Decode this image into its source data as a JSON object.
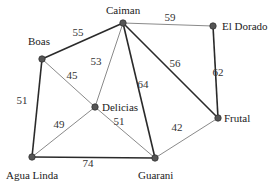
{
  "graph": {
    "nodes": [
      {
        "id": "caiman",
        "label": "Caiman"
      },
      {
        "id": "eldorado",
        "label": "El Dorado"
      },
      {
        "id": "boas",
        "label": "Boas"
      },
      {
        "id": "delicias",
        "label": "Delicias"
      },
      {
        "id": "frutal",
        "label": "Frutal"
      },
      {
        "id": "agualinda",
        "label": "Agua Linda"
      },
      {
        "id": "guarani",
        "label": "Guarani"
      }
    ],
    "edges": [
      {
        "from": "boas",
        "to": "caiman",
        "weight": "55",
        "highlighted": true
      },
      {
        "from": "caiman",
        "to": "eldorado",
        "weight": "59",
        "highlighted": false
      },
      {
        "from": "caiman",
        "to": "delicias",
        "weight": "53",
        "highlighted": false
      },
      {
        "from": "caiman",
        "to": "guarani",
        "weight": "64",
        "highlighted": true
      },
      {
        "from": "caiman",
        "to": "frutal",
        "weight": "56",
        "highlighted": true
      },
      {
        "from": "eldorado",
        "to": "frutal",
        "weight": "62",
        "highlighted": true
      },
      {
        "from": "boas",
        "to": "delicias",
        "weight": "45",
        "highlighted": false
      },
      {
        "from": "boas",
        "to": "agualinda",
        "weight": "51",
        "highlighted": true
      },
      {
        "from": "delicias",
        "to": "agualinda",
        "weight": "49",
        "highlighted": false
      },
      {
        "from": "delicias",
        "to": "guarani",
        "weight": "51",
        "highlighted": false
      },
      {
        "from": "agualinda",
        "to": "guarani",
        "weight": "74",
        "highlighted": true
      },
      {
        "from": "frutal",
        "to": "guarani",
        "weight": "42",
        "highlighted": false
      }
    ]
  }
}
